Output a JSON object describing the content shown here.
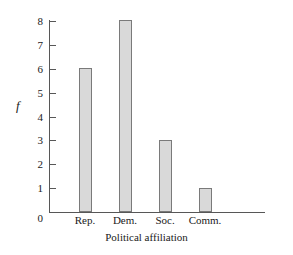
{
  "chart_data": {
    "type": "bar",
    "title": "",
    "subtitle": "",
    "categories": [
      "Rep.",
      "Dem.",
      "Soc.",
      "Comm."
    ],
    "values": [
      6,
      8,
      3,
      1
    ],
    "xlabel": "Political affiliation",
    "ylabel": "f",
    "ylim": [
      0,
      8
    ],
    "yticks": [
      1,
      2,
      3,
      4,
      5,
      6,
      7,
      8
    ],
    "ytick_labels": [
      "1",
      "2",
      "3",
      "4",
      "5",
      "6",
      "7",
      "8"
    ],
    "origin_label": "0",
    "grid": false,
    "legend": null,
    "annotations": [],
    "colors": {
      "bar_fill": "#d9d9d9",
      "bar_stroke": "#7a7a7a",
      "axis": "#575757",
      "text": "#1a1a1a",
      "background": "#ffffff"
    }
  }
}
